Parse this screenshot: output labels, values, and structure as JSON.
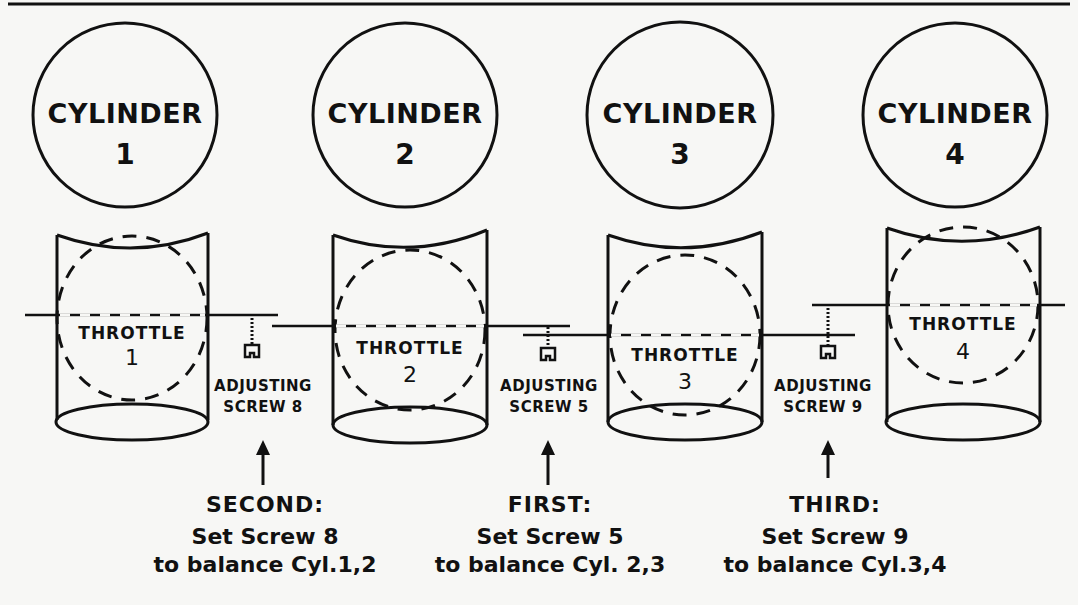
{
  "colors": {
    "ink": "#111111",
    "paper": "#f7f7f5"
  },
  "cylinders": [
    {
      "label": "CYLINDER",
      "number": "1"
    },
    {
      "label": "CYLINDER",
      "number": "2"
    },
    {
      "label": "CYLINDER",
      "number": "3"
    },
    {
      "label": "CYLINDER",
      "number": "4"
    }
  ],
  "throttles": [
    {
      "label": "THROTTLE",
      "number": "1"
    },
    {
      "label": "THROTTLE",
      "number": "2"
    },
    {
      "label": "THROTTLE",
      "number": "3"
    },
    {
      "label": "THROTTLE",
      "number": "4"
    }
  ],
  "adjusting_screws": [
    {
      "line1": "ADJUSTING",
      "line2": "SCREW 8"
    },
    {
      "line1": "ADJUSTING",
      "line2": "SCREW 5"
    },
    {
      "line1": "ADJUSTING",
      "line2": "SCREW 9"
    }
  ],
  "steps": [
    {
      "order": "SECOND:",
      "action": "Set Screw 8",
      "purpose": "to balance Cyl.1,2"
    },
    {
      "order": "FIRST:",
      "action": "Set Screw 5",
      "purpose": "to balance Cyl. 2,3"
    },
    {
      "order": "THIRD:",
      "action": "Set Screw 9",
      "purpose": "to balance Cyl.3,4"
    }
  ]
}
